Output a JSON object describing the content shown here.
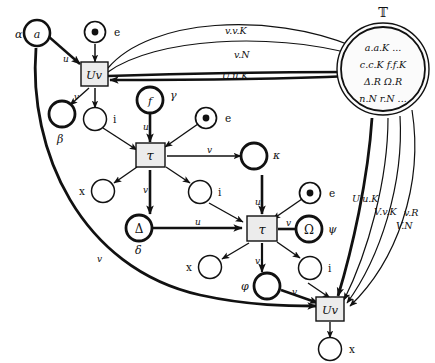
{
  "diagram": {
    "title_symbol": "ᵀ",
    "big_place": {
      "name": "T",
      "outer_label": "𝕋",
      "lines": [
        "a.a.K ...",
        "c.c.K  f.f.K",
        "Δ.R  Ω.R",
        "n.N  r.N ..."
      ]
    },
    "transitions": [
      {
        "id": "uv-top",
        "label": "Uv"
      },
      {
        "id": "tau-upper",
        "label": "τ"
      },
      {
        "id": "tau-lower",
        "label": "τ"
      },
      {
        "id": "uv-bottom",
        "label": "Uv"
      }
    ],
    "places": [
      {
        "id": "alpha",
        "greek": "α",
        "inner": "a",
        "bold": true,
        "token": false
      },
      {
        "id": "beta",
        "greek": "β",
        "inner": "",
        "bold": true,
        "token": false
      },
      {
        "id": "gamma",
        "greek": "γ",
        "inner": "f",
        "bold": true,
        "token": false
      },
      {
        "id": "kappa",
        "greek": "κ",
        "inner": "",
        "bold": true,
        "token": false
      },
      {
        "id": "delta",
        "greek": "δ",
        "inner": "Δ",
        "bold": true,
        "token": false
      },
      {
        "id": "psi",
        "greek": "ψ",
        "inner": "Ω",
        "bold": true,
        "token": false
      },
      {
        "id": "phi",
        "greek": "φ",
        "inner": "",
        "bold": true,
        "token": false
      },
      {
        "id": "e1",
        "greek": "e",
        "inner": "",
        "bold": false,
        "token": true
      },
      {
        "id": "e2",
        "greek": "e",
        "inner": "",
        "bold": false,
        "token": true
      },
      {
        "id": "e3",
        "greek": "e",
        "inner": "",
        "bold": false,
        "token": true
      },
      {
        "id": "i1",
        "greek": "i",
        "inner": "",
        "bold": false,
        "token": false
      },
      {
        "id": "i2",
        "greek": "i",
        "inner": "",
        "bold": false,
        "token": false
      },
      {
        "id": "i3",
        "greek": "i",
        "inner": "",
        "bold": false,
        "token": false
      },
      {
        "id": "i4",
        "greek": "i",
        "inner": "",
        "bold": false,
        "token": false
      },
      {
        "id": "x1",
        "greek": "x",
        "inner": "",
        "bold": false,
        "token": false
      },
      {
        "id": "x2",
        "greek": "x",
        "inner": "",
        "bold": false,
        "token": false
      },
      {
        "id": "x3",
        "greek": "x",
        "inner": "",
        "bold": false,
        "token": false
      }
    ],
    "arc_labels": {
      "alpha_u": "u",
      "uvtop_v": "v",
      "uvtop_i": "",
      "gamma_u": "u",
      "tau_upper_out_v": "v",
      "tau_upper_down_v": "v",
      "delta_u": "u",
      "tau_lower_out_v": "v",
      "tau_lower_down_v": "v",
      "phi_v": "v",
      "long_curve_v": "v",
      "to_T_1": "v.v.K",
      "to_T_2": "v.N",
      "to_T_3": "U.u.K",
      "from_T_1": "U.u.K",
      "from_T_2": "V.v.K",
      "from_T_3": "v.R",
      "from_T_4": "V.N"
    }
  }
}
